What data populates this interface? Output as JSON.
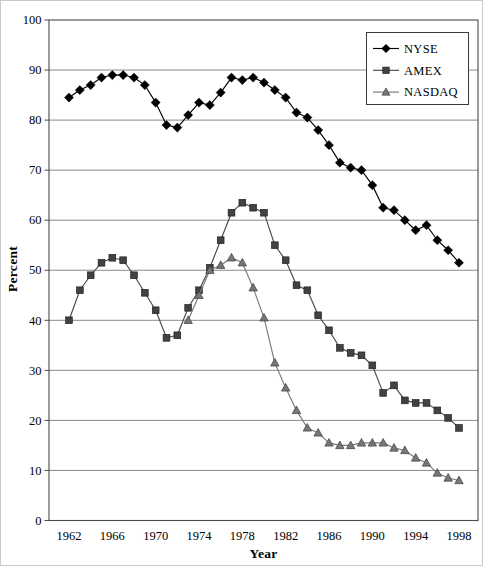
{
  "figure": {
    "background": "#ffffff",
    "border_color": "#c9c9c9"
  },
  "chart_data": {
    "type": "line",
    "title": "",
    "xlabel": "Year",
    "ylabel": "Percent",
    "ylim": [
      0,
      100
    ],
    "y_tick_step": 10,
    "x_ticks": [
      "1962",
      "1966",
      "1970",
      "1974",
      "1978",
      "1982",
      "1986",
      "1990",
      "1994",
      "1998"
    ],
    "years": [
      1962,
      1963,
      1964,
      1965,
      1966,
      1967,
      1968,
      1969,
      1970,
      1971,
      1972,
      1973,
      1974,
      1975,
      1976,
      1977,
      1978,
      1979,
      1980,
      1981,
      1982,
      1983,
      1984,
      1985,
      1986,
      1987,
      1988,
      1989,
      1990,
      1991,
      1992,
      1993,
      1994,
      1995,
      1996,
      1997,
      1998
    ],
    "grid": "horizontal-only",
    "axis_color": "#4a4a4a",
    "grid_color": "#8a8a8a",
    "legend": {
      "position": "top-right",
      "border_color": "#3a3a3a",
      "background": "#ffffff"
    },
    "series": [
      {
        "name": "NYSE",
        "marker": "diamond",
        "line_color": "#000000",
        "marker_color": "#000000",
        "values": [
          84.5,
          86,
          87,
          88.5,
          89,
          89,
          88.5,
          87,
          83.5,
          79,
          78.5,
          81,
          83.5,
          83,
          85.5,
          88.5,
          88,
          88.5,
          87.5,
          86,
          84.5,
          81.5,
          80.5,
          78,
          75,
          71.5,
          70.5,
          70,
          67,
          62.5,
          62,
          60,
          58,
          59,
          56,
          54,
          51.5
        ]
      },
      {
        "name": "AMEX",
        "marker": "square",
        "line_color": "#4a4a4a",
        "marker_color": "#424242",
        "values": [
          40,
          46,
          49,
          51.5,
          52.5,
          52,
          49,
          45.5,
          42,
          36.5,
          37,
          42.5,
          46,
          50.5,
          56,
          61.5,
          63.5,
          62.5,
          61.5,
          55,
          52,
          47,
          46,
          41,
          38,
          34.5,
          33.5,
          33,
          31,
          25.5,
          27,
          24,
          23.5,
          23.5,
          22,
          20.5,
          18.5
        ]
      },
      {
        "name": "NASDAQ",
        "marker": "triangle",
        "line_color": "#7a7a7a",
        "marker_color": "#777777",
        "values": [
          null,
          null,
          null,
          null,
          null,
          null,
          null,
          null,
          null,
          null,
          null,
          40,
          45,
          50,
          51,
          52.5,
          51.5,
          46.5,
          40.5,
          31.5,
          26.5,
          22,
          18.5,
          17.5,
          15.5,
          15,
          15,
          15.5,
          15.5,
          15.5,
          14.5,
          14,
          12.5,
          11.5,
          9.5,
          8.5,
          8
        ]
      }
    ]
  }
}
